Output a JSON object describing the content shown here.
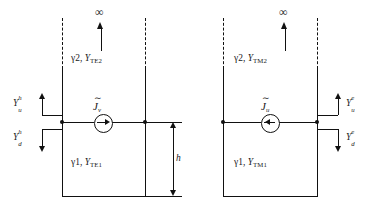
{
  "figure": {
    "type": "equivalent-transmission-line-network",
    "panels": [
      {
        "id": "te",
        "name": "TE equivalent network",
        "infinity_symbol": "∞",
        "upper_region_label": {
          "gamma": "γ2,",
          "admittance": "Y",
          "admittance_sub": "TE2"
        },
        "lower_region_label": {
          "gamma": "γ1,",
          "admittance": "Y",
          "admittance_sub": "TE1"
        },
        "source": {
          "symbol": "J",
          "tilde": "∼",
          "subscript": "v",
          "direction": "right"
        },
        "admittance_up": {
          "symbol": "Y",
          "sub": "u",
          "sup": "h"
        },
        "admittance_down": {
          "symbol": "Y",
          "sub": "d",
          "sup": "h"
        },
        "admittance_side": "left",
        "dimension": {
          "label": "h",
          "shown": true
        }
      },
      {
        "id": "tm",
        "name": "TM equivalent network",
        "infinity_symbol": "∞",
        "upper_region_label": {
          "gamma": "γ2,",
          "admittance": "Y",
          "admittance_sub": "TM2"
        },
        "lower_region_label": {
          "gamma": "γ1,",
          "admittance": "Y",
          "admittance_sub": "TM1"
        },
        "source": {
          "symbol": "J",
          "tilde": "∼",
          "subscript": "u",
          "direction": "left"
        },
        "admittance_up": {
          "symbol": "Y",
          "sub": "u",
          "sup": "e"
        },
        "admittance_down": {
          "symbol": "Y",
          "sub": "d",
          "sup": "e"
        },
        "admittance_side": "right",
        "dimension": {
          "label": "h",
          "shown": false
        }
      }
    ],
    "colors": {
      "line": "#111111",
      "background": "#ffffff"
    }
  }
}
